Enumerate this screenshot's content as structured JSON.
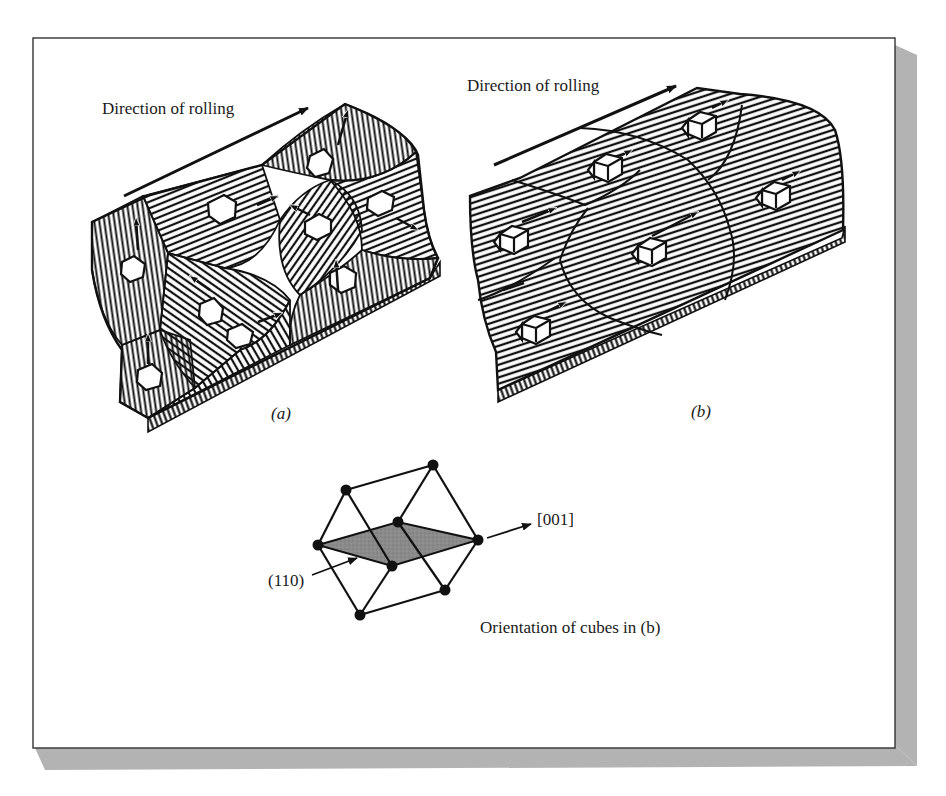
{
  "figure": {
    "panel_a": {
      "caption": "(a)",
      "direction_label": "Direction of rolling"
    },
    "panel_b": {
      "caption": "(b)",
      "direction_label": "Direction of rolling"
    },
    "unit_cell": {
      "plane_label": "(110)",
      "direction_label": "[001]",
      "caption": "Orientation of cubes in (b)"
    }
  },
  "colors": {
    "background": "#ffffff",
    "frame_border": "#333333",
    "shadow": "#b0b0b0",
    "ink": "#1a1a1a",
    "plane_fill": "#8a8a8a"
  }
}
